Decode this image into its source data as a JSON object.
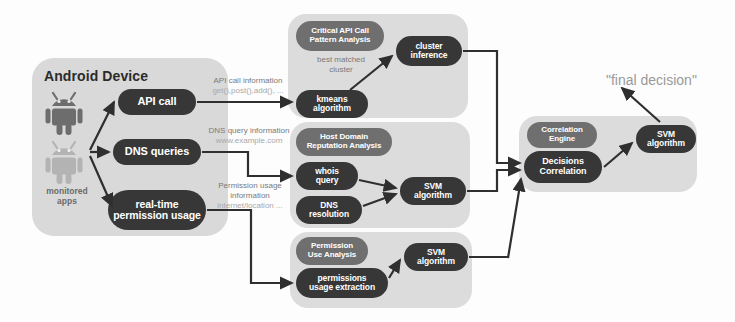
{
  "diagram": {
    "title_final": "\"final decision\"",
    "device_panel": {
      "title": "Android Device",
      "apps_caption_line1": "monitored",
      "apps_caption_line2": "apps",
      "nodes": [
        {
          "id": "api-call",
          "label": "API call"
        },
        {
          "id": "dns-queries",
          "label": "DNS queries"
        },
        {
          "id": "permission-usage",
          "label_line1": "real-time",
          "label_line2": "permission usage"
        }
      ]
    },
    "edge_labels": [
      {
        "id": "api-info",
        "line1": "API call information",
        "line2": "get(),post(),add(), ..."
      },
      {
        "id": "dns-info",
        "line1": "DNS query information",
        "line2": "www.example.com"
      },
      {
        "id": "perm-info",
        "line1": "Permission usage",
        "line1b": "information",
        "line2": "internet/location ..."
      }
    ],
    "clusters": [
      {
        "id": "critical-api-call",
        "header_line1": "Critical API Call",
        "header_line2": "Pattern Analysis",
        "inner_label_line1": "best matched",
        "inner_label_line2": "cluster",
        "nodes": [
          {
            "id": "kmeans",
            "line1": "kmeans",
            "line2": "algorithm"
          },
          {
            "id": "cluster-inference",
            "line1": "cluster",
            "line2": "inference"
          }
        ]
      },
      {
        "id": "host-domain-reputation",
        "header_line1": "Host Domain",
        "header_line2": "Reputation Analysis",
        "nodes": [
          {
            "id": "whois-query",
            "line1": "whois",
            "line2": "query"
          },
          {
            "id": "dns-resolution",
            "line1": "DNS",
            "line2": "resolution"
          },
          {
            "id": "svm-domain",
            "line1": "SVM",
            "line2": "algorithm"
          }
        ]
      },
      {
        "id": "permission-use",
        "header_line1": "Permission",
        "header_line2": "Use Analysis",
        "nodes": [
          {
            "id": "permissions-extraction",
            "line1": "permissions",
            "line2": "usage extraction"
          },
          {
            "id": "svm-permission",
            "line1": "SVM",
            "line2": "algorithm"
          }
        ]
      },
      {
        "id": "correlation-engine",
        "header_line1": "Correlation",
        "header_line2": "Engine",
        "nodes": [
          {
            "id": "decisions-correlation",
            "line1": "Decisions",
            "line2": "Correlation"
          },
          {
            "id": "svm-final",
            "line1": "SVM",
            "line2": "algorithm"
          }
        ]
      }
    ],
    "colors": {
      "node_dark": "#373737",
      "node_mid": "#6f6f6f",
      "panel_bg": "#dcdcdc",
      "wire": "#2f2f2f",
      "muted_text": "#8e8e8e",
      "title_text": "#2b2b2b"
    }
  }
}
